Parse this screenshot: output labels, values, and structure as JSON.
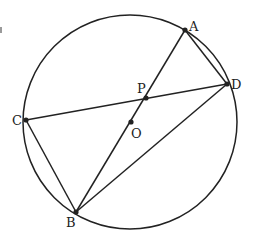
{
  "figure": {
    "type": "circle-geometry",
    "stroke_color": "#222222",
    "background": "#ffffff",
    "circle": {
      "name": "O",
      "cx": 130,
      "cy": 122,
      "r": 107
    },
    "points": {
      "A": {
        "label": "A",
        "x": 185,
        "y": 30,
        "label_x": 189,
        "label_y": 31
      },
      "D": {
        "label": "D",
        "x": 227,
        "y": 84,
        "label_x": 231,
        "label_y": 89
      },
      "C": {
        "label": "C",
        "x": 26,
        "y": 120,
        "label_x": 12,
        "label_y": 125
      },
      "B": {
        "label": "B",
        "x": 76,
        "y": 212,
        "label_x": 66,
        "label_y": 227
      },
      "P": {
        "label": "P",
        "x": 146,
        "y": 98,
        "label_x": 137,
        "label_y": 93
      },
      "O": {
        "label": "O",
        "x": 131,
        "y": 122,
        "label_x": 131,
        "label_y": 138
      }
    },
    "segments": [
      {
        "from": "A",
        "to": "B"
      },
      {
        "from": "C",
        "to": "D"
      },
      {
        "from": "A",
        "to": "D"
      },
      {
        "from": "B",
        "to": "D"
      },
      {
        "from": "C",
        "to": "B"
      }
    ]
  }
}
